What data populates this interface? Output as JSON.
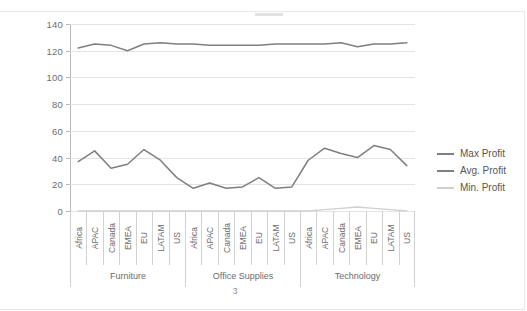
{
  "page": {
    "number": "3"
  },
  "legend": {
    "position": "right",
    "items": [
      {
        "label": "Max Profit",
        "color": "#7f7f7f"
      },
      {
        "label": "Avg. Profit",
        "color": "#7f7f7f"
      },
      {
        "label": "Min. Profit",
        "color": "#d0d0d0"
      }
    ]
  },
  "axis": {
    "y_ticks": [
      "0",
      "20",
      "40",
      "60",
      "80",
      "100",
      "120",
      "140"
    ]
  },
  "groups": [
    {
      "label": "Furniture",
      "count": 7
    },
    {
      "label": "Office Supplies",
      "count": 7
    },
    {
      "label": "Technology",
      "count": 7
    }
  ],
  "chart_data": {
    "type": "line",
    "title": "",
    "xlabel": "",
    "ylabel": "",
    "ylim": [
      0,
      140
    ],
    "ytick_step": 20,
    "grid": true,
    "legend_position": "right",
    "categories": [
      "Africa",
      "APAC",
      "Canada",
      "EMEA",
      "EU",
      "LATAM",
      "US",
      "Africa",
      "APAC",
      "Canada",
      "EMEA",
      "EU",
      "LATAM",
      "US",
      "Africa",
      "APAC",
      "Canada",
      "EMEA",
      "EU",
      "LATAM",
      "US"
    ],
    "group_labels": [
      "Furniture",
      "Office Supplies",
      "Technology"
    ],
    "group_size": 7,
    "series": [
      {
        "name": "Max Profit",
        "color": "#7f7f7f",
        "values": [
          37,
          45,
          32,
          35,
          46,
          38,
          25,
          17,
          21,
          17,
          18,
          25,
          17,
          18,
          38,
          47,
          43,
          40,
          49,
          46,
          34
        ]
      },
      {
        "name": "Avg. Profit",
        "color": "#7f7f7f",
        "values": [
          122,
          125,
          124,
          120,
          125,
          126,
          125,
          125,
          124,
          124,
          124,
          124,
          125,
          125,
          125,
          125,
          126,
          123,
          125,
          125,
          126
        ]
      },
      {
        "name": "Min. Profit",
        "color": "#d0d0d0",
        "values": [
          0,
          0,
          0,
          0,
          0,
          0,
          0,
          0,
          0,
          0,
          0,
          0,
          0,
          0,
          0,
          1,
          2,
          3,
          2,
          1,
          0
        ]
      }
    ]
  }
}
